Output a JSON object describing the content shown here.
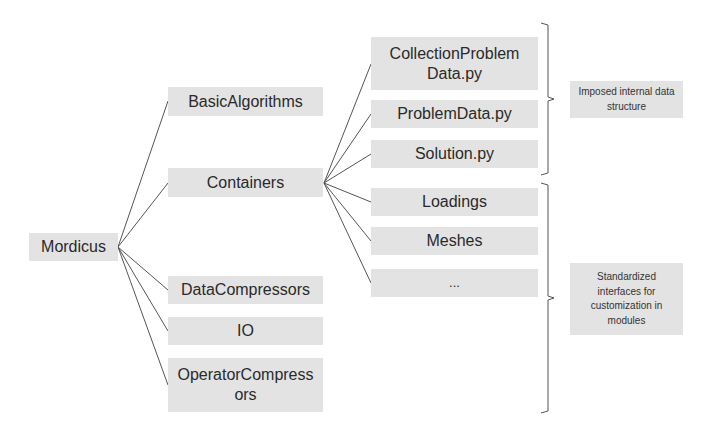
{
  "diagram": {
    "root": {
      "label": "Mordicus"
    },
    "modules": [
      {
        "label": "BasicAlgorithms"
      },
      {
        "label": "Containers"
      },
      {
        "label": "DataCompressors"
      },
      {
        "label": "IO"
      },
      {
        "label": "OperatorCompressors"
      }
    ],
    "container_children": [
      {
        "label": "CollectionProblemData.py",
        "display": "CollectionProblem\nData.py"
      },
      {
        "label": "ProblemData.py"
      },
      {
        "label": "Solution.py"
      },
      {
        "label": "Loadings"
      },
      {
        "label": "Meshes"
      },
      {
        "label": "..."
      }
    ],
    "annotations": [
      {
        "label": "Imposed internal data structure",
        "groups": [
          "CollectionProblemData.py",
          "ProblemData.py",
          "Solution.py"
        ]
      },
      {
        "label": "Standardized interfaces for customization in modules",
        "groups": [
          "Loadings",
          "Meshes",
          "..."
        ]
      }
    ],
    "colors": {
      "box_fill": "#e3e3e3",
      "line": "#555555",
      "text": "#2a2a2a"
    }
  }
}
